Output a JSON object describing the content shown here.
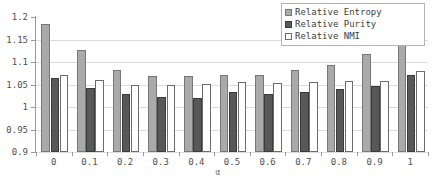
{
  "chart_data": {
    "type": "bar",
    "title": "",
    "xlabel": "α",
    "ylabel": "",
    "ylim": [
      0.9,
      1.2
    ],
    "ytick_values": [
      1.2,
      1.15,
      1.1,
      1.05,
      1,
      0.95,
      0.9
    ],
    "ytick_labels": [
      "1.2",
      "1.15",
      "1.1",
      "1.05",
      "1",
      "0.95",
      "0.9"
    ],
    "grid": true,
    "legend_position": "top-right",
    "categories": [
      "0",
      "0.1",
      "0.2",
      "0.3",
      "0.4",
      "0.5",
      "0.6",
      "0.7",
      "0.8",
      "0.9",
      "1"
    ],
    "series": [
      {
        "name": "Relative Entropy",
        "color": "#aaaaaa",
        "edge_color": "#777777",
        "values": [
          1.185,
          1.127,
          1.082,
          1.068,
          1.068,
          1.072,
          1.072,
          1.083,
          1.094,
          1.117,
          1.172
        ]
      },
      {
        "name": "Relative Purity",
        "color": "#585858",
        "edge_color": "#3b3b3b",
        "values": [
          1.064,
          1.042,
          1.03,
          1.023,
          1.021,
          1.033,
          1.029,
          1.033,
          1.04,
          1.046,
          1.071
        ]
      },
      {
        "name": "Relative NMI",
        "color": "#ffffff",
        "edge_color": "#6d6d6d",
        "values": [
          1.072,
          1.059,
          1.049,
          1.05,
          1.051,
          1.056,
          1.054,
          1.056,
          1.058,
          1.058,
          1.081
        ]
      }
    ]
  }
}
